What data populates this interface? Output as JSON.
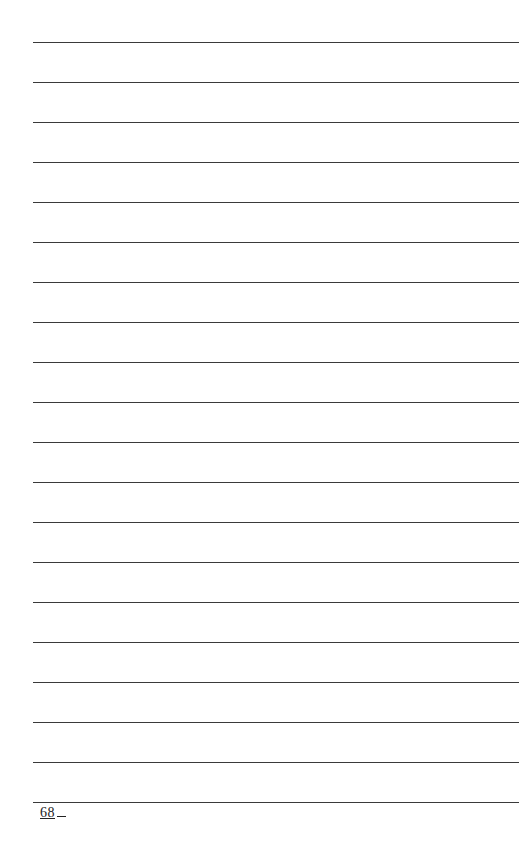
{
  "page": {
    "type": "lined-notes-page",
    "line_count": 20,
    "first_line_y": 42,
    "line_spacing": 40,
    "line_color": "#3a3a3a",
    "page_number": "68"
  }
}
